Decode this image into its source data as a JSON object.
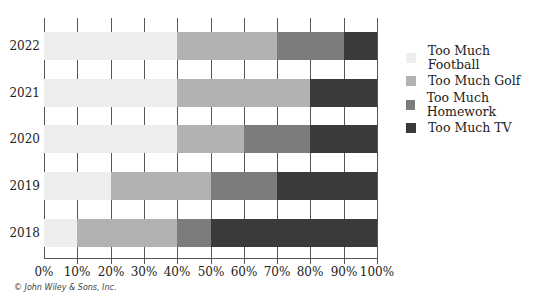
{
  "chart_data": {
    "type": "bar",
    "orientation": "horizontal",
    "stacked": "percent",
    "title": "",
    "xlabel": "",
    "ylabel": "",
    "categories": [
      "2022",
      "2021",
      "2020",
      "2019",
      "2018"
    ],
    "series": [
      {
        "name": "Too Much Football",
        "color": "#eeeeee",
        "values": [
          40,
          40,
          40,
          20,
          10
        ]
      },
      {
        "name": "Too Much Golf",
        "color": "#b2b2b2",
        "values": [
          30,
          40,
          20,
          30,
          30
        ]
      },
      {
        "name": "Too Much Homework",
        "color": "#7c7c7c",
        "values": [
          20,
          0,
          20,
          20,
          10
        ]
      },
      {
        "name": "Too Much TV",
        "color": "#3a3a3a",
        "values": [
          10,
          20,
          20,
          30,
          50
        ]
      }
    ],
    "xlim": [
      0,
      100
    ],
    "xticks": [
      "0%",
      "10%",
      "20%",
      "30%",
      "40%",
      "50%",
      "60%",
      "70%",
      "80%",
      "90%",
      "100%"
    ],
    "grid": true,
    "legend_position": "right"
  },
  "credit": "© John Wiley & Sons, Inc."
}
